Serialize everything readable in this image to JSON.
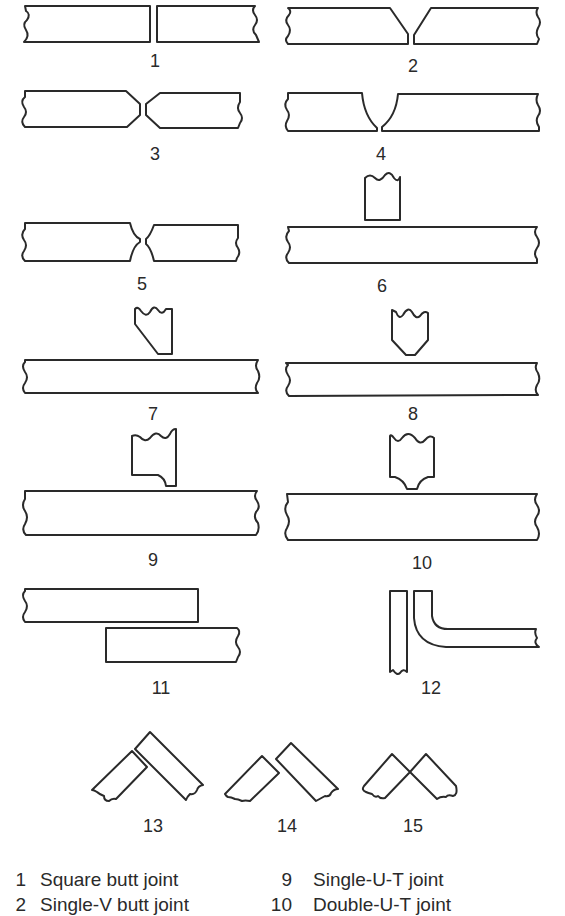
{
  "figure": {
    "labels": [
      "1",
      "2",
      "3",
      "4",
      "5",
      "6",
      "7",
      "8",
      "9",
      "10",
      "11",
      "12",
      "13",
      "14",
      "15"
    ],
    "stroke_color": "#2a2a2a",
    "background": "#ffffff"
  },
  "legend": {
    "left": [
      {
        "num": "1",
        "text": "Square butt joint"
      },
      {
        "num": "2",
        "text": "Single-V butt joint"
      }
    ],
    "right": [
      {
        "num": "9",
        "text": "Single-U-T joint"
      },
      {
        "num": "10",
        "text": "Double-U-T joint"
      }
    ]
  }
}
